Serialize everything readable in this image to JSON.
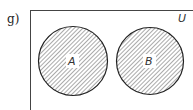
{
  "problem_label": "g)",
  "diagram": {
    "type": "venn",
    "universe_label": "U",
    "sets": [
      {
        "label": "A",
        "shaded": true
      },
      {
        "label": "B",
        "shaded": true
      }
    ],
    "overlap": false,
    "shading": "hatched",
    "colors": {
      "stroke": "#222222",
      "hatch": "#555555",
      "background": "#ffffff"
    }
  }
}
